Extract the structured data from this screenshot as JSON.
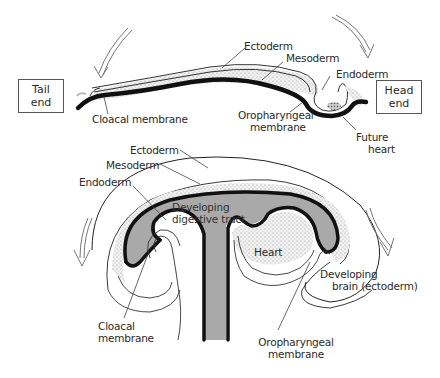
{
  "top_diagram": {
    "boxes": {
      "tail": [
        "Tail",
        "end"
      ],
      "head": [
        "Head",
        "end"
      ]
    },
    "labels": {
      "ectoderm": "Ectoderm",
      "mesoderm": "Mesoderm",
      "endoderm": "Endoderm",
      "cloacal_membrane": "Cloacal membrane",
      "oropharyngeal_membrane": [
        "Oropharyngeal",
        "membrane"
      ],
      "future_heart": [
        "Future",
        "heart"
      ]
    }
  },
  "bottom_diagram": {
    "labels": {
      "ectoderm": "Ectoderm",
      "mesoderm": "Mesoderm",
      "endoderm": "Endoderm",
      "developing_digestive_tract": [
        "Developing",
        "digestive tract"
      ],
      "heart": "Heart",
      "developing_brain": [
        "Developing",
        "brain (ectoderm)"
      ],
      "cloacal_membrane": [
        "Cloacal",
        "membrane"
      ],
      "oropharyngeal_membrane": [
        "Oropharyngeal",
        "membrane"
      ]
    }
  },
  "colors": {
    "gut_fill": "#a9a9a9",
    "mesoderm_stipple": "#e6e6e6",
    "outline": "#111111",
    "thin_line": "#444444"
  }
}
